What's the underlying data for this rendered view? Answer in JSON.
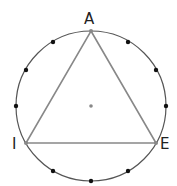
{
  "diagram": {
    "circle": {
      "cx": 91,
      "cy": 106,
      "r": 75,
      "stroke": "#555555"
    },
    "center_point": {
      "x": 91,
      "y": 106,
      "color": "#888888"
    },
    "triangle": {
      "stroke": "#888888",
      "vertices": [
        {
          "label": "A",
          "x": 91,
          "y": 31,
          "label_x": 84,
          "label_y": 24
        },
        {
          "label": "E",
          "x": 156,
          "y": 143,
          "label_x": 160,
          "label_y": 149
        },
        {
          "label": "I",
          "x": 26,
          "y": 143,
          "label_x": 12,
          "label_y": 149
        }
      ]
    },
    "dots": [
      {
        "x": 128,
        "y": 42
      },
      {
        "x": 156,
        "y": 70
      },
      {
        "x": 166,
        "y": 106
      },
      {
        "x": 128,
        "y": 171
      },
      {
        "x": 91,
        "y": 181
      },
      {
        "x": 53,
        "y": 171
      },
      {
        "x": 16,
        "y": 106
      },
      {
        "x": 26,
        "y": 70
      },
      {
        "x": 53,
        "y": 42
      }
    ],
    "dot_color": "#111111"
  }
}
